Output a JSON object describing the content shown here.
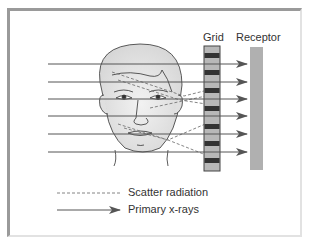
{
  "figure": {
    "labels": {
      "grid": "Grid",
      "receptor": "Receptor"
    },
    "legend": [
      {
        "style": "dashed",
        "label": "Scatter radiation"
      },
      {
        "style": "arrow",
        "label": "Primary x-rays"
      }
    ],
    "primary_ray_count": 6,
    "colors": {
      "ray": "#555555",
      "grid_light": "#b8b8b8",
      "grid_dark": "#333333",
      "receptor": "#b0b0b0",
      "skin": "#e6e6e6"
    }
  }
}
